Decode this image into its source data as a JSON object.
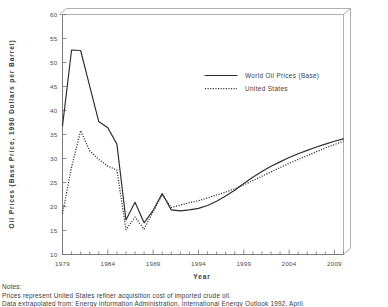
{
  "chart_data": {
    "type": "line",
    "title": "",
    "xlabel": "Year",
    "ylabel": "Oil Prices (Base Price, 1990 Dollars per Barrel)",
    "xlim": [
      1979,
      2010
    ],
    "ylim": [
      10,
      60
    ],
    "xticks": [
      1979,
      1984,
      1989,
      1994,
      1999,
      2004,
      2009
    ],
    "xticks_labels": [
      "1979",
      "1984",
      "1989",
      "1994",
      "1999",
      "2004",
      "2009"
    ],
    "x_minor_step": 1,
    "yticks": [
      10,
      15,
      20,
      25,
      30,
      35,
      40,
      45,
      50,
      55,
      60
    ],
    "yticks_labels": [
      "10",
      "15",
      "20",
      "25",
      "30",
      "35",
      "40",
      "45",
      "50",
      "55",
      "60"
    ],
    "grid": false,
    "legend_position": "upper-center-right",
    "x": [
      1979,
      1980,
      1981,
      1982,
      1983,
      1984,
      1985,
      1986,
      1987,
      1988,
      1989,
      1990,
      1991,
      1992,
      1993,
      1994,
      1995,
      1996,
      1997,
      1998,
      1999,
      2000,
      2001,
      2002,
      2003,
      2004,
      2005,
      2006,
      2007,
      2008,
      2009,
      2010
    ],
    "series": [
      {
        "name": "World Oil Prices (Base)",
        "style": "solid",
        "color": "#2b2b2b",
        "values": [
          36.8,
          52.6,
          52.5,
          45.1,
          37.7,
          36.4,
          33.0,
          17.2,
          20.9,
          16.6,
          19.2,
          22.7,
          19.3,
          19.1,
          19.3,
          19.6,
          20.2,
          21.1,
          22.2,
          23.4,
          24.8,
          26.1,
          27.3,
          28.4,
          29.3,
          30.2,
          31.0,
          31.7,
          32.4,
          33.0,
          33.6,
          34.1
        ]
      },
      {
        "name": "United States",
        "style": "dotted",
        "color": "#2b2b2b",
        "values": [
          18.5,
          28.2,
          35.8,
          31.6,
          29.8,
          28.4,
          27.6,
          15.2,
          17.8,
          15.3,
          18.9,
          22.5,
          19.8,
          20.3,
          20.8,
          21.2,
          21.8,
          22.4,
          23.0,
          23.7,
          24.5,
          25.4,
          26.3,
          27.2,
          28.1,
          29.0,
          29.8,
          30.6,
          31.4,
          32.2,
          32.9,
          33.6
        ]
      }
    ]
  },
  "legend": {
    "entries": [
      {
        "label": "World Oil Prices (Base)",
        "style": "solid"
      },
      {
        "label": "United States",
        "style": "dotted"
      }
    ]
  },
  "notes": {
    "heading": "Notes:",
    "lines": [
      "Prices represent United States refiner acquisition cost of imported crude oil.",
      "Data extrapolated from:  Energy Information Administration, International Energy Outlook 1992, April."
    ]
  }
}
